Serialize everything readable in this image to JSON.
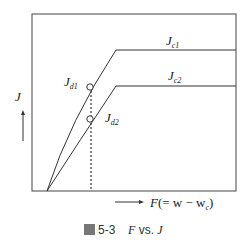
{
  "figure": {
    "caption_prefix": "圖",
    "caption_number": "5-3",
    "caption_text_F": "F",
    "caption_text_vs": " vs. ",
    "caption_text_J": "J"
  },
  "axes": {
    "y_label": "J",
    "x_label_F": "F",
    "x_label_expr": "(= w − w",
    "x_label_sub": "c",
    "x_label_close": ")"
  },
  "curves": [
    {
      "name": "J",
      "sub": "c1",
      "role": "upper curve"
    },
    {
      "name": "J",
      "sub": "c2",
      "role": "lower curve"
    }
  ],
  "points": [
    {
      "name": "J",
      "sub": "d1"
    },
    {
      "name": "J",
      "sub": "d2"
    }
  ],
  "colors": {
    "line": "#333333",
    "background": "#ffffff"
  }
}
